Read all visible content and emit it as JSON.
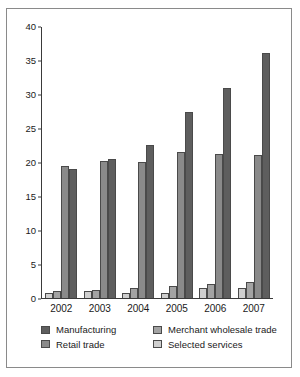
{
  "chart_data": {
    "type": "bar",
    "title": "",
    "subtitle": "",
    "xlabel": "",
    "ylabel": "",
    "categories": [
      "2002",
      "2003",
      "2004",
      "2005",
      "2006",
      "2007"
    ],
    "ylim": [
      0,
      40
    ],
    "yticks": [
      0,
      5,
      10,
      15,
      20,
      25,
      30,
      35,
      40
    ],
    "ytick_labels": [
      "0",
      "5",
      "10",
      "15",
      "20",
      "25",
      "30",
      "35",
      "40"
    ],
    "grid": false,
    "legend_position": "bottom",
    "series": [
      {
        "name": "Selected services",
        "color": "#cfcfcf",
        "values": [
          0.7,
          1.0,
          0.8,
          0.8,
          1.4,
          1.4
        ]
      },
      {
        "name": "Merchant wholesale trade",
        "color": "#a3a3a3",
        "values": [
          1.0,
          1.2,
          1.4,
          1.8,
          2.0,
          2.4
        ]
      },
      {
        "name": "Retail trade",
        "color": "#8a8a8a",
        "values": [
          19.4,
          20.1,
          20.0,
          21.4,
          21.2,
          21.0
        ]
      },
      {
        "name": "Manufacturing",
        "color": "#5e5e5e",
        "values": [
          19.0,
          20.4,
          22.5,
          27.4,
          30.9,
          36.0
        ]
      }
    ]
  },
  "legend": {
    "items": [
      {
        "label": "Manufacturing",
        "color": "#5e5e5e",
        "icon": "legend-swatch"
      },
      {
        "label": "Merchant wholesale trade",
        "color": "#a3a3a3",
        "icon": "legend-swatch"
      },
      {
        "label": "Retail trade",
        "color": "#8a8a8a",
        "icon": "legend-swatch"
      },
      {
        "label": "Selected services",
        "color": "#cfcfcf",
        "icon": "legend-swatch"
      }
    ]
  }
}
